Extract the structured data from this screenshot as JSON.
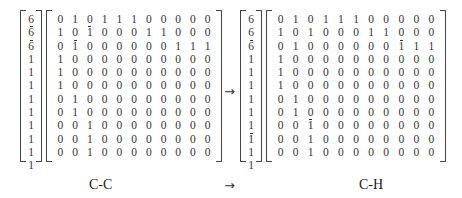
{
  "equation": {
    "left": {
      "vector": [
        "6",
        "6",
        "6",
        "1",
        "1",
        "1",
        "1",
        "1",
        "1",
        "1",
        "1",
        "1"
      ],
      "vector_bars": [
        false,
        true,
        true,
        false,
        false,
        false,
        false,
        false,
        false,
        false,
        false,
        false
      ],
      "matrix": [
        [
          "0",
          "1",
          "0",
          "1",
          "1",
          "1",
          "0",
          "0",
          "0",
          "0",
          "0"
        ],
        [
          "1",
          "0",
          "1",
          "0",
          "0",
          "0",
          "1",
          "1",
          "0",
          "0",
          "0"
        ],
        [
          "0",
          "1",
          "0",
          "0",
          "0",
          "0",
          "0",
          "0",
          "1",
          "1",
          "1"
        ],
        [
          "1",
          "0",
          "0",
          "0",
          "0",
          "0",
          "0",
          "0",
          "0",
          "0",
          "0"
        ],
        [
          "1",
          "0",
          "0",
          "0",
          "0",
          "0",
          "0",
          "0",
          "0",
          "0",
          "0"
        ],
        [
          "1",
          "0",
          "0",
          "0",
          "0",
          "0",
          "0",
          "0",
          "0",
          "0",
          "0"
        ],
        [
          "0",
          "1",
          "0",
          "0",
          "0",
          "0",
          "0",
          "0",
          "0",
          "0",
          "0"
        ],
        [
          "0",
          "1",
          "0",
          "0",
          "0",
          "0",
          "0",
          "0",
          "0",
          "0",
          "0"
        ],
        [
          "0",
          "0",
          "1",
          "0",
          "0",
          "0",
          "0",
          "0",
          "0",
          "0",
          "0"
        ],
        [
          "0",
          "0",
          "1",
          "0",
          "0",
          "0",
          "0",
          "0",
          "0",
          "0",
          "0"
        ],
        [
          "0",
          "0",
          "1",
          "0",
          "0",
          "0",
          "0",
          "0",
          "0",
          "0",
          "0"
        ]
      ],
      "matrix_bars": [
        [
          1,
          2
        ],
        [
          2,
          1
        ]
      ],
      "label": "C-C"
    },
    "arrow": "→",
    "right": {
      "vector": [
        "6",
        "6",
        "6",
        "1",
        "1",
        "1",
        "1",
        "1",
        "1",
        "1",
        "1",
        "1"
      ],
      "vector_bars": [
        false,
        false,
        true,
        false,
        false,
        false,
        false,
        false,
        false,
        true,
        false,
        false
      ],
      "matrix": [
        [
          "0",
          "1",
          "0",
          "1",
          "1",
          "1",
          "0",
          "0",
          "0",
          "0",
          "0"
        ],
        [
          "1",
          "0",
          "1",
          "0",
          "0",
          "0",
          "1",
          "1",
          "0",
          "0",
          "0"
        ],
        [
          "0",
          "1",
          "0",
          "0",
          "0",
          "0",
          "0",
          "0",
          "1",
          "1",
          "1"
        ],
        [
          "1",
          "0",
          "0",
          "0",
          "0",
          "0",
          "0",
          "0",
          "0",
          "0",
          "0"
        ],
        [
          "1",
          "0",
          "0",
          "0",
          "0",
          "0",
          "0",
          "0",
          "0",
          "0",
          "0"
        ],
        [
          "1",
          "0",
          "0",
          "0",
          "0",
          "0",
          "0",
          "0",
          "0",
          "0",
          "0"
        ],
        [
          "0",
          "1",
          "0",
          "0",
          "0",
          "0",
          "0",
          "0",
          "0",
          "0",
          "0"
        ],
        [
          "0",
          "1",
          "0",
          "0",
          "0",
          "0",
          "0",
          "0",
          "0",
          "0",
          "0"
        ],
        [
          "0",
          "0",
          "1",
          "0",
          "0",
          "0",
          "0",
          "0",
          "0",
          "0",
          "0"
        ],
        [
          "0",
          "0",
          "1",
          "0",
          "0",
          "0",
          "0",
          "0",
          "0",
          "0",
          "0"
        ],
        [
          "0",
          "0",
          "1",
          "0",
          "0",
          "0",
          "0",
          "0",
          "0",
          "0",
          "0"
        ]
      ],
      "matrix_bars": [
        [
          2,
          8
        ],
        [
          8,
          2
        ]
      ],
      "label": "C-H"
    },
    "caption_arrow": "→"
  }
}
